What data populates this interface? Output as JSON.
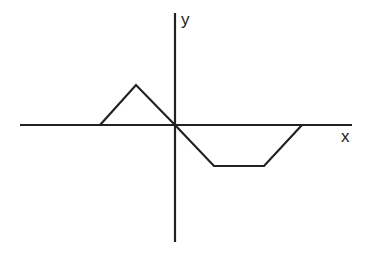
{
  "diagram": {
    "type": "function-graph",
    "axes": {
      "x_label": "x",
      "y_label": "y",
      "origin_px": [
        175,
        125
      ],
      "x_axis_px": {
        "x1": 20,
        "x2": 352,
        "y": 125
      },
      "y_axis_px": {
        "x": 175,
        "y1": 13,
        "y2": 242
      },
      "stroke_color": "#222222"
    },
    "curve": {
      "description": "piecewise linear: triangle above axis left of origin, trapezoid below axis right of origin",
      "points_px": [
        [
          100,
          125
        ],
        [
          136,
          85
        ],
        [
          175,
          125
        ],
        [
          214,
          166
        ],
        [
          264,
          166
        ],
        [
          302,
          125
        ]
      ],
      "stroke_color": "#222222"
    }
  }
}
